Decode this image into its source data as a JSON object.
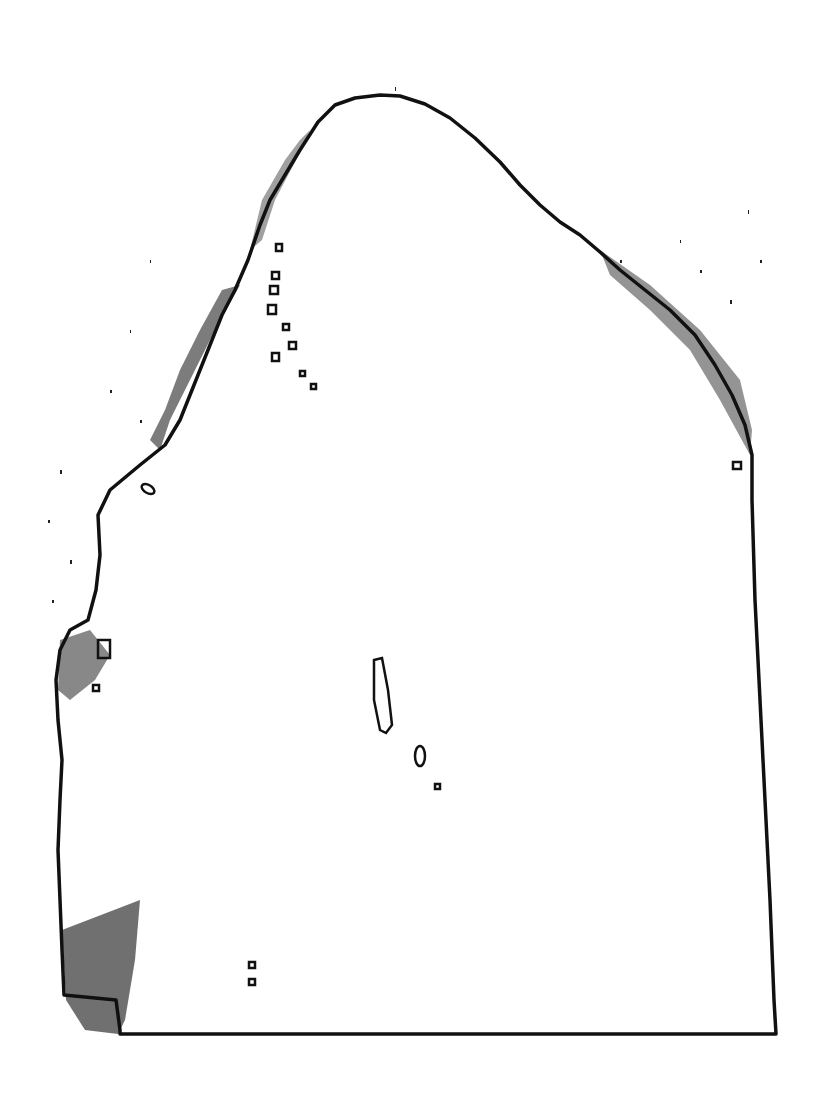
{
  "figure": {
    "kind": "contour-outline",
    "background_color": "#ffffff",
    "stroke_color": "#111111",
    "text_labels": []
  }
}
